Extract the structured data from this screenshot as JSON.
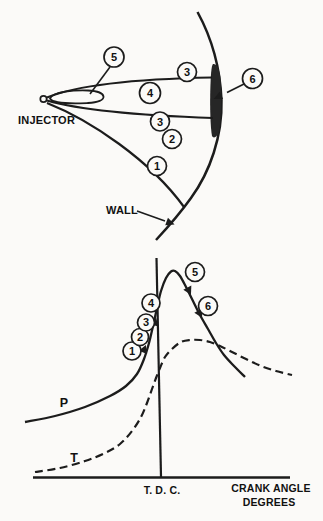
{
  "figure": {
    "background_color": "#fbfaf8",
    "ink_color": "#1c1c1c",
    "description_visible_text_only": true
  },
  "top": {
    "injector_label": "INJECTOR",
    "wall_label": "WALL",
    "callouts": [
      "5",
      "3",
      "4",
      "3",
      "2",
      "1",
      "6"
    ]
  },
  "chart_data": {
    "type": "line",
    "title": "",
    "xlabel": "CRANK ANGLE DEGREES",
    "xlabel_lines": [
      "CRANK ANGLE",
      "DEGREES"
    ],
    "ylabel": "",
    "tdc_label": "T. D. C.",
    "axes_numeric_labels": false,
    "grid": false,
    "annotations": [
      "1",
      "2",
      "3",
      "4",
      "5",
      "6"
    ],
    "series": [
      {
        "name": "P",
        "style": "solid",
        "shape": "rises slowly, steepens before T.D.C., peaks just after T.D.C., then falls",
        "points": [
          [
            25,
            422
          ],
          [
            55,
            416
          ],
          [
            85,
            407
          ],
          [
            110,
            396
          ],
          [
            126,
            386
          ],
          [
            137,
            374
          ],
          [
            144,
            359
          ],
          [
            149,
            343
          ],
          [
            153,
            326
          ],
          [
            157,
            308
          ],
          [
            161,
            291
          ],
          [
            166,
            278
          ],
          [
            171,
            271.5
          ],
          [
            175,
            271
          ],
          [
            180,
            276
          ],
          [
            186,
            287
          ],
          [
            193,
            301
          ],
          [
            200,
            315
          ],
          [
            208,
            329
          ],
          [
            216,
            343
          ],
          [
            224,
            355
          ],
          [
            234,
            366
          ],
          [
            245,
            377
          ]
        ]
      },
      {
        "name": "T",
        "style": "dashed",
        "shape": "low before T.D.C., rises steeply through T.D.C., flat crest after T.D.C., slow decline",
        "points": [
          [
            35,
            472
          ],
          [
            60,
            468
          ],
          [
            85,
            461
          ],
          [
            105,
            453
          ],
          [
            120,
            444
          ],
          [
            132,
            431
          ],
          [
            141,
            417
          ],
          [
            147,
            403
          ],
          [
            152,
            389
          ],
          [
            156,
            378
          ],
          [
            160,
            368
          ],
          [
            165,
            357
          ],
          [
            172,
            349
          ],
          [
            181,
            342
          ],
          [
            190,
            340
          ],
          [
            200,
            340
          ],
          [
            210,
            342
          ],
          [
            220,
            346
          ],
          [
            232,
            352
          ],
          [
            246,
            359
          ],
          [
            261,
            366
          ],
          [
            276,
            371
          ],
          [
            292,
            375
          ]
        ]
      }
    ]
  }
}
